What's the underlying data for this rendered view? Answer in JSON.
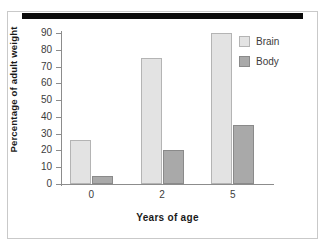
{
  "figure": {
    "redaction_bar": "",
    "background_color": "#ffffff",
    "frame_color": "#c9c9c9"
  },
  "legend": {
    "position": "top-right",
    "entries": [
      {
        "label": "Brain",
        "color": "#e3e3e3"
      },
      {
        "label": "Body",
        "color": "#a9a9a9"
      }
    ]
  },
  "axes": {
    "y_title": "Percentage of adult weight",
    "x_title": "Years of age",
    "y_ticks": [
      "90",
      "80",
      "70",
      "60",
      "50",
      "40",
      "30",
      "20",
      "10",
      "0"
    ],
    "x_categories": [
      "0",
      "2",
      "5"
    ]
  },
  "chart_data": {
    "type": "bar",
    "title": "",
    "categories": [
      "0",
      "2",
      "5"
    ],
    "series": [
      {
        "name": "Brain",
        "values": [
          26,
          75,
          90
        ],
        "color": "#e3e3e3"
      },
      {
        "name": "Body",
        "values": [
          4.5,
          20,
          35
        ],
        "color": "#a9a9a9"
      }
    ],
    "xlabel": "Years of age",
    "ylabel": "Percentage of adult weight",
    "ylim": [
      0,
      90
    ],
    "ytick_step": 10,
    "grid": false,
    "legend_position": "top-right"
  }
}
